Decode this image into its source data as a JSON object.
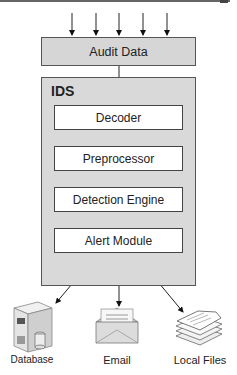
{
  "diagram": {
    "title": "IDS",
    "input": {
      "label": "Audit Data",
      "incoming_arrows": 5
    },
    "components": [
      {
        "label": "Decoder"
      },
      {
        "label": "Preprocessor"
      },
      {
        "label": "Detection Engine"
      },
      {
        "label": "Alert Module"
      }
    ],
    "outputs": [
      {
        "label": "Database",
        "icon": "server-database-icon"
      },
      {
        "label": "Email",
        "icon": "envelope-icon"
      },
      {
        "label": "Local Files",
        "icon": "documents-stack-icon"
      }
    ],
    "colors": {
      "box_fill": "#d9d9d9",
      "inner_fill": "#ffffff",
      "stroke": "#444444"
    }
  }
}
